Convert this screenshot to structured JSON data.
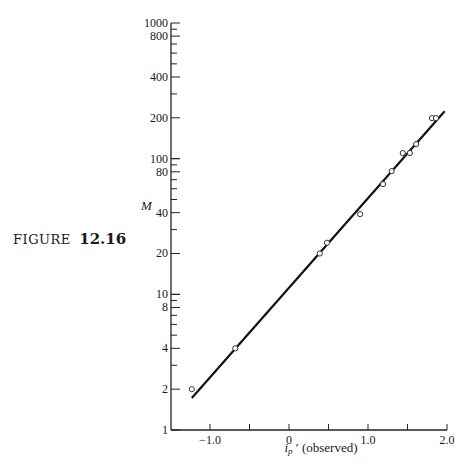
{
  "figure": {
    "label_word": "FIGURE",
    "label_number": "12.16"
  },
  "chart_data": {
    "type": "scatter",
    "title": "",
    "xlabel_main": "i",
    "xlabel_sub": "p",
    "xlabel_prime": "′",
    "xlabel_suffix": "(observed)",
    "xlabel": "i_p' (observed)",
    "ylabel": "M",
    "xlim": [
      -1.5,
      2.0
    ],
    "ylim": [
      1,
      1000
    ],
    "yscale": "log",
    "grid": false,
    "legend": null,
    "x_ticks": [
      -1.0,
      -0.5,
      0,
      0.5,
      1.0,
      1.5,
      2.0
    ],
    "x_tick_labels": [
      {
        "value": -1.0,
        "label": "−1.0"
      },
      {
        "value": 0,
        "label": "0"
      },
      {
        "value": 1.0,
        "label": "1.0"
      },
      {
        "value": 2.0,
        "label": "2.0"
      }
    ],
    "y_tick_labels": [
      {
        "value": 1,
        "label": "1"
      },
      {
        "value": 2,
        "label": "2"
      },
      {
        "value": 4,
        "label": "4"
      },
      {
        "value": 8,
        "label": "8"
      },
      {
        "value": 10,
        "label": "10"
      },
      {
        "value": 20,
        "label": "20"
      },
      {
        "value": 40,
        "label": "40"
      },
      {
        "value": 80,
        "label": "80"
      },
      {
        "value": 100,
        "label": "100"
      },
      {
        "value": 200,
        "label": "200"
      },
      {
        "value": 400,
        "label": "400"
      },
      {
        "value": 800,
        "label": "800"
      },
      {
        "value": 1000,
        "label": "1000"
      }
    ],
    "series": [
      {
        "name": "observed",
        "marker": "open-circle",
        "points": [
          {
            "x": -1.23,
            "y": 2.0
          },
          {
            "x": -0.68,
            "y": 4.0
          },
          {
            "x": 0.39,
            "y": 20
          },
          {
            "x": 0.48,
            "y": 24
          },
          {
            "x": 0.9,
            "y": 39
          },
          {
            "x": 1.19,
            "y": 65
          },
          {
            "x": 1.3,
            "y": 81
          },
          {
            "x": 1.44,
            "y": 110
          },
          {
            "x": 1.53,
            "y": 110
          },
          {
            "x": 1.61,
            "y": 128
          },
          {
            "x": 1.81,
            "y": 199
          },
          {
            "x": 1.86,
            "y": 199
          }
        ]
      },
      {
        "name": "fit",
        "type": "line",
        "points": [
          {
            "x": -1.23,
            "y": 1.72
          },
          {
            "x": 1.97,
            "y": 224
          }
        ]
      }
    ]
  }
}
